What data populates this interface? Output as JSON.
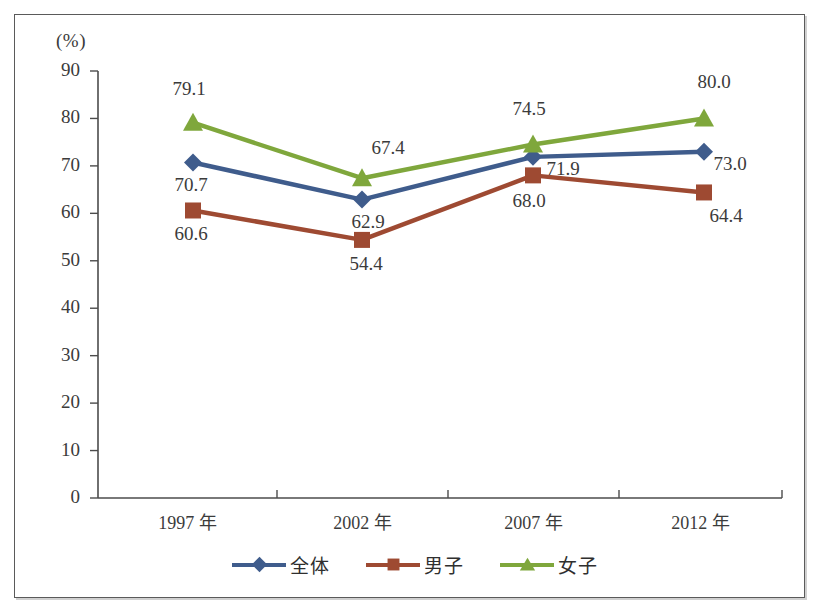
{
  "figure": {
    "unit_label": "(%)",
    "frame_color": "#5a5a5a",
    "background": "#ffffff"
  },
  "legend": {
    "position": "bottom-center",
    "items": [
      {
        "label": "全体",
        "color": "#3F5C8C",
        "marker": "diamond",
        "marker_name": "diamond-marker-icon"
      },
      {
        "label": "男子",
        "color": "#9E4A32",
        "marker": "square",
        "marker_name": "square-marker-icon"
      },
      {
        "label": "女子",
        "color": "#7FA73C",
        "marker": "triangle",
        "marker_name": "triangle-marker-icon"
      }
    ]
  },
  "axes": {
    "y_ticks": [
      "0",
      "10",
      "20",
      "30",
      "40",
      "50",
      "60",
      "70",
      "80",
      "90"
    ],
    "x_ticks": [
      "1997 年",
      "2002 年",
      "2007 年",
      "2012 年"
    ]
  },
  "chart_data": {
    "type": "line",
    "title": "",
    "xlabel": "",
    "ylabel": "(%)",
    "categories": [
      "1997 年",
      "2002 年",
      "2007 年",
      "2012 年"
    ],
    "ylim": [
      0,
      90
    ],
    "ytick_step": 10,
    "grid": false,
    "legend_position": "bottom",
    "series": [
      {
        "name": "全体",
        "color": "#3F5C8C",
        "marker": "diamond",
        "values": [
          70.7,
          62.9,
          71.9,
          73.0
        ],
        "labels": [
          "70.7",
          "62.9",
          "71.9",
          "73.0"
        ]
      },
      {
        "name": "男子",
        "color": "#9E4A32",
        "marker": "square",
        "values": [
          60.6,
          54.4,
          68.0,
          64.4
        ],
        "labels": [
          "60.6",
          "54.4",
          "68.0",
          "64.4"
        ]
      },
      {
        "name": "女子",
        "color": "#7FA73C",
        "marker": "triangle",
        "values": [
          79.1,
          67.4,
          74.5,
          80.0
        ],
        "labels": [
          "79.1",
          "67.4",
          "74.5",
          "80.0"
        ]
      }
    ]
  },
  "caption": ""
}
